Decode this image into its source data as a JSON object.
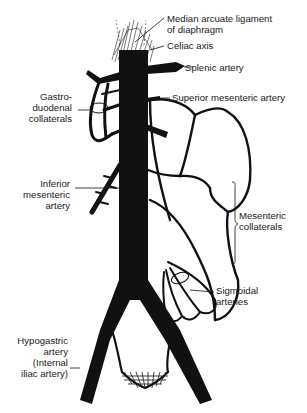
{
  "diagram": {
    "type": "anatomical-illustration",
    "colors": {
      "ink": "#111111",
      "background": "#ffffff",
      "text": "#1a1a1a"
    },
    "labels": {
      "median_arcuate": "Median arcuate ligament\nof diaphragm",
      "celiac_axis": "Celiac axis",
      "splenic_artery": "Splenic artery",
      "superior_mesenteric": "Superior mesenteric artery",
      "gastroduodenal": "Gastro-\nduodenal\ncollaterals",
      "inferior_mesenteric": "Inferior\nmesenteric\nartery",
      "mesenteric_collaterals": "Mesenteric\ncollaterals",
      "sigmoidal_arteries": "Sigmoidal\narteries",
      "hypogastric": "Hypogastric\nartery\n(Internal\niliac artery)"
    }
  }
}
